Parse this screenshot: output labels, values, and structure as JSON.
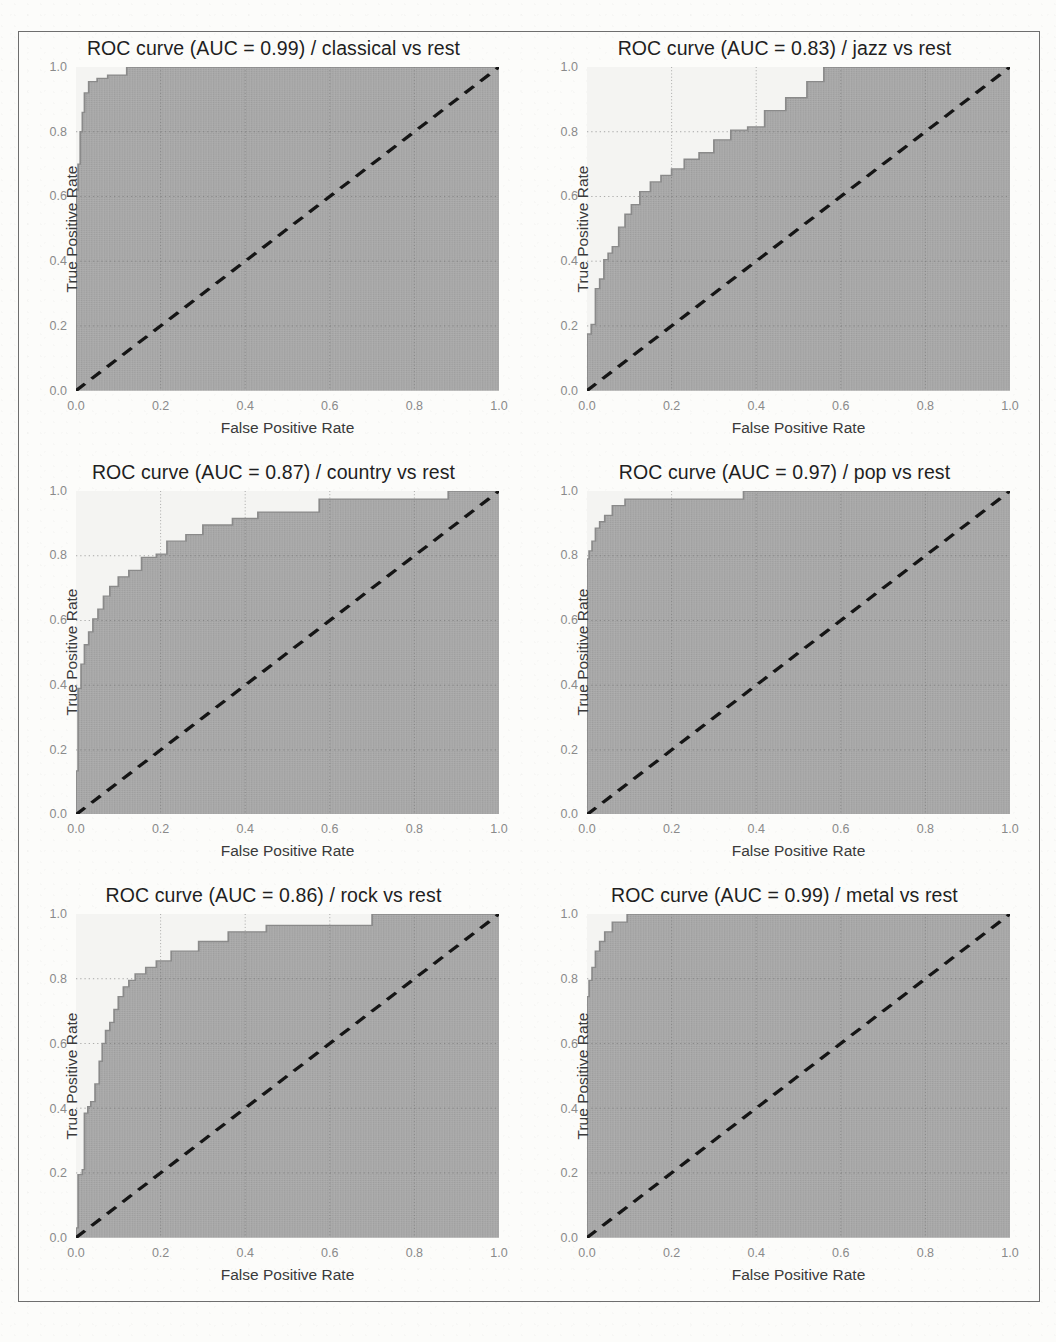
{
  "figure": {
    "layout": "3 rows x 2 columns",
    "background_color": "#fcfcfa",
    "border_color": "#6e6e6e"
  },
  "axis": {
    "xlabel": "False Positive Rate",
    "ylabel": "True Positive Rate",
    "xticks": [
      "0.0",
      "0.2",
      "0.4",
      "0.6",
      "0.8",
      "1.0"
    ],
    "yticks": [
      "0.0",
      "0.2",
      "0.4",
      "0.6",
      "0.8",
      "1.0"
    ],
    "fill_color": "#a9a9a9",
    "upper_color": "#f4f4f2",
    "curve_color": "#8a8a8a",
    "diagonal_color": "#151515"
  },
  "chart_data": [
    {
      "type": "line",
      "title": "ROC curve (AUC = 0.99) / classical vs rest",
      "auc": 0.99,
      "class_label": "classical",
      "comparison": "vs rest",
      "xlabel": "False Positive Rate",
      "ylabel": "True Positive Rate",
      "xlim": [
        0.0,
        1.0
      ],
      "ylim": [
        0.0,
        1.0
      ],
      "grid": true,
      "legend": "none",
      "series": [
        {
          "name": "ROC",
          "x": [
            0.0,
            0.0,
            0.005,
            0.005,
            0.01,
            0.01,
            0.015,
            0.015,
            0.02,
            0.02,
            0.03,
            0.03,
            0.05,
            0.05,
            0.075,
            0.075,
            0.12,
            0.12,
            1.0
          ],
          "y": [
            0.0,
            0.62,
            0.62,
            0.7,
            0.7,
            0.8,
            0.8,
            0.86,
            0.86,
            0.92,
            0.92,
            0.955,
            0.955,
            0.965,
            0.965,
            0.975,
            0.975,
            1.0,
            1.0
          ]
        },
        {
          "name": "chance",
          "x": [
            0.0,
            1.0
          ],
          "y": [
            0.0,
            1.0
          ],
          "style": "dashed"
        }
      ]
    },
    {
      "type": "line",
      "title": "ROC curve (AUC = 0.83) / jazz vs rest",
      "auc": 0.83,
      "class_label": "jazz",
      "comparison": "vs rest",
      "xlabel": "False Positive Rate",
      "ylabel": "True Positive Rate",
      "xlim": [
        0.0,
        1.0
      ],
      "ylim": [
        0.0,
        1.0
      ],
      "grid": true,
      "legend": "none",
      "series": [
        {
          "name": "ROC",
          "x": [
            0.0,
            0.0,
            0.01,
            0.01,
            0.02,
            0.02,
            0.03,
            0.03,
            0.04,
            0.04,
            0.05,
            0.05,
            0.06,
            0.06,
            0.075,
            0.075,
            0.09,
            0.09,
            0.105,
            0.105,
            0.125,
            0.125,
            0.15,
            0.15,
            0.175,
            0.175,
            0.2,
            0.2,
            0.23,
            0.23,
            0.265,
            0.265,
            0.3,
            0.3,
            0.34,
            0.34,
            0.38,
            0.38,
            0.42,
            0.42,
            0.47,
            0.47,
            0.52,
            0.52,
            0.56,
            0.56,
            1.0
          ],
          "y": [
            0.0,
            0.175,
            0.175,
            0.205,
            0.205,
            0.315,
            0.315,
            0.345,
            0.345,
            0.405,
            0.405,
            0.425,
            0.425,
            0.445,
            0.445,
            0.505,
            0.505,
            0.545,
            0.545,
            0.575,
            0.575,
            0.615,
            0.615,
            0.645,
            0.645,
            0.665,
            0.665,
            0.685,
            0.685,
            0.715,
            0.715,
            0.735,
            0.735,
            0.775,
            0.775,
            0.805,
            0.805,
            0.815,
            0.815,
            0.865,
            0.865,
            0.905,
            0.905,
            0.955,
            0.955,
            1.0,
            1.0
          ]
        },
        {
          "name": "chance",
          "x": [
            0.0,
            1.0
          ],
          "y": [
            0.0,
            1.0
          ],
          "style": "dashed"
        }
      ]
    },
    {
      "type": "line",
      "title": "ROC curve (AUC = 0.87) / country vs rest",
      "auc": 0.87,
      "class_label": "country",
      "comparison": "vs rest",
      "xlabel": "False Positive Rate",
      "ylabel": "True Positive Rate",
      "xlim": [
        0.0,
        1.0
      ],
      "ylim": [
        0.0,
        1.0
      ],
      "grid": true,
      "legend": "none",
      "series": [
        {
          "name": "ROC",
          "x": [
            0.0,
            0.0,
            0.005,
            0.005,
            0.012,
            0.012,
            0.02,
            0.02,
            0.03,
            0.03,
            0.04,
            0.04,
            0.052,
            0.052,
            0.065,
            0.065,
            0.08,
            0.08,
            0.1,
            0.1,
            0.125,
            0.125,
            0.155,
            0.155,
            0.19,
            0.19,
            0.215,
            0.215,
            0.26,
            0.26,
            0.3,
            0.3,
            0.37,
            0.37,
            0.43,
            0.43,
            0.575,
            0.575,
            0.88,
            0.88,
            1.0
          ],
          "y": [
            0.0,
            0.135,
            0.135,
            0.39,
            0.39,
            0.465,
            0.465,
            0.525,
            0.525,
            0.565,
            0.565,
            0.605,
            0.605,
            0.635,
            0.635,
            0.675,
            0.675,
            0.705,
            0.705,
            0.735,
            0.735,
            0.755,
            0.755,
            0.795,
            0.795,
            0.805,
            0.805,
            0.845,
            0.845,
            0.865,
            0.865,
            0.895,
            0.895,
            0.915,
            0.915,
            0.935,
            0.935,
            0.975,
            0.975,
            1.0,
            1.0
          ]
        },
        {
          "name": "chance",
          "x": [
            0.0,
            1.0
          ],
          "y": [
            0.0,
            1.0
          ],
          "style": "dashed"
        }
      ]
    },
    {
      "type": "line",
      "title": "ROC curve (AUC = 0.97) / pop vs rest",
      "auc": 0.97,
      "class_label": "pop",
      "comparison": "vs rest",
      "xlabel": "False Positive Rate",
      "ylabel": "True Positive Rate",
      "xlim": [
        0.0,
        1.0
      ],
      "ylim": [
        0.0,
        1.0
      ],
      "grid": true,
      "legend": "none",
      "series": [
        {
          "name": "ROC",
          "x": [
            0.0,
            0.0,
            0.005,
            0.005,
            0.012,
            0.012,
            0.02,
            0.02,
            0.03,
            0.03,
            0.042,
            0.042,
            0.06,
            0.06,
            0.09,
            0.09,
            0.37,
            0.37,
            1.0
          ],
          "y": [
            0.0,
            0.79,
            0.79,
            0.815,
            0.815,
            0.845,
            0.845,
            0.885,
            0.885,
            0.905,
            0.905,
            0.925,
            0.925,
            0.955,
            0.955,
            0.975,
            0.975,
            1.0,
            1.0
          ]
        },
        {
          "name": "chance",
          "x": [
            0.0,
            1.0
          ],
          "y": [
            0.0,
            1.0
          ],
          "style": "dashed"
        }
      ]
    },
    {
      "type": "line",
      "title": "ROC curve (AUC = 0.86) / rock vs rest",
      "auc": 0.86,
      "class_label": "rock",
      "comparison": "vs rest",
      "xlabel": "False Positive Rate",
      "ylabel": "True Positive Rate",
      "xlim": [
        0.0,
        1.0
      ],
      "ylim": [
        0.0,
        1.0
      ],
      "grid": true,
      "legend": "none",
      "series": [
        {
          "name": "ROC",
          "x": [
            0.0,
            0.0,
            0.005,
            0.005,
            0.015,
            0.015,
            0.02,
            0.02,
            0.028,
            0.028,
            0.035,
            0.035,
            0.045,
            0.045,
            0.055,
            0.055,
            0.062,
            0.062,
            0.07,
            0.07,
            0.08,
            0.08,
            0.09,
            0.09,
            0.1,
            0.1,
            0.112,
            0.112,
            0.125,
            0.125,
            0.14,
            0.14,
            0.165,
            0.165,
            0.19,
            0.19,
            0.225,
            0.225,
            0.29,
            0.29,
            0.36,
            0.36,
            0.45,
            0.45,
            0.7,
            0.7,
            1.0
          ],
          "y": [
            0.0,
            0.03,
            0.03,
            0.195,
            0.195,
            0.21,
            0.21,
            0.385,
            0.385,
            0.405,
            0.405,
            0.42,
            0.42,
            0.475,
            0.475,
            0.545,
            0.545,
            0.6,
            0.6,
            0.64,
            0.64,
            0.665,
            0.665,
            0.705,
            0.705,
            0.745,
            0.745,
            0.775,
            0.775,
            0.795,
            0.795,
            0.815,
            0.815,
            0.835,
            0.835,
            0.855,
            0.855,
            0.885,
            0.885,
            0.915,
            0.915,
            0.945,
            0.945,
            0.965,
            0.965,
            1.0,
            1.0
          ]
        },
        {
          "name": "chance",
          "x": [
            0.0,
            1.0
          ],
          "y": [
            0.0,
            1.0
          ],
          "style": "dashed"
        }
      ]
    },
    {
      "type": "line",
      "title": "ROC curve (AUC = 0.99) / metal vs rest",
      "auc": 0.99,
      "class_label": "metal",
      "comparison": "vs rest",
      "xlabel": "False Positive Rate",
      "ylabel": "True Positive Rate",
      "xlim": [
        0.0,
        1.0
      ],
      "ylim": [
        0.0,
        1.0
      ],
      "grid": true,
      "legend": "none",
      "series": [
        {
          "name": "ROC",
          "x": [
            0.0,
            0.0,
            0.005,
            0.005,
            0.012,
            0.012,
            0.02,
            0.02,
            0.03,
            0.03,
            0.042,
            0.042,
            0.06,
            0.06,
            0.095,
            0.095,
            1.0
          ],
          "y": [
            0.0,
            0.745,
            0.745,
            0.795,
            0.795,
            0.835,
            0.835,
            0.885,
            0.885,
            0.915,
            0.915,
            0.945,
            0.945,
            0.975,
            0.975,
            1.0,
            1.0
          ]
        },
        {
          "name": "chance",
          "x": [
            0.0,
            1.0
          ],
          "y": [
            0.0,
            1.0
          ],
          "style": "dashed"
        }
      ]
    }
  ]
}
